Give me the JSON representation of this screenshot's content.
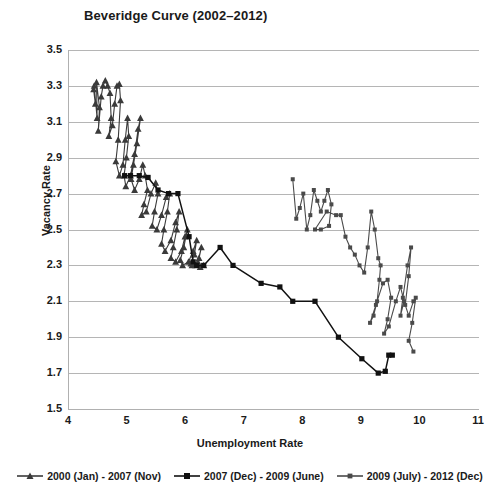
{
  "chart_data": {
    "type": "scatter",
    "title": "Beveridge Curve (2002–2012)",
    "xlabel": "Unemployment Rate",
    "ylabel": "Vacancy Rate",
    "xlim": [
      4,
      11
    ],
    "ylim": [
      1.5,
      3.5
    ],
    "xticks": [
      "4",
      "5",
      "6",
      "7",
      "8",
      "9",
      "10",
      "11"
    ],
    "yticks": [
      "3.5",
      "3.3",
      "3.1",
      "2.9",
      "2.7",
      "2.5",
      "2.3",
      "2.1",
      "1.9",
      "1.7",
      "1.5"
    ],
    "grid": true,
    "legend_position": "bottom",
    "series": [
      {
        "name": "2000 (Jan) - 2007 (Nov)",
        "marker": "triangle",
        "color": "#3a3a3a",
        "points": [
          [
            4.42,
            3.28
          ],
          [
            4.45,
            3.2
          ],
          [
            4.43,
            3.3
          ],
          [
            4.48,
            3.12
          ],
          [
            4.47,
            3.32
          ],
          [
            4.52,
            3.18
          ],
          [
            4.5,
            3.05
          ],
          [
            4.55,
            3.24
          ],
          [
            4.58,
            3.3
          ],
          [
            4.62,
            3.33
          ],
          [
            4.66,
            3.3
          ],
          [
            4.7,
            3.26
          ],
          [
            4.72,
            3.12
          ],
          [
            4.68,
            3.02
          ],
          [
            4.74,
            3.08
          ],
          [
            4.78,
            3.2
          ],
          [
            4.82,
            3.3
          ],
          [
            4.86,
            3.31
          ],
          [
            4.88,
            3.22
          ],
          [
            4.84,
            3.0
          ],
          [
            4.8,
            2.88
          ],
          [
            4.86,
            2.8
          ],
          [
            4.92,
            2.86
          ],
          [
            4.96,
            3.0
          ],
          [
            5.0,
            3.12
          ],
          [
            5.02,
            3.02
          ],
          [
            4.98,
            2.9
          ],
          [
            4.94,
            2.8
          ],
          [
            4.97,
            2.74
          ],
          [
            5.05,
            2.8
          ],
          [
            5.12,
            2.92
          ],
          [
            5.18,
            3.06
          ],
          [
            5.22,
            3.12
          ],
          [
            5.16,
            2.98
          ],
          [
            5.1,
            2.86
          ],
          [
            5.06,
            2.78
          ],
          [
            5.12,
            2.72
          ],
          [
            5.2,
            2.78
          ],
          [
            5.26,
            2.86
          ],
          [
            5.3,
            2.8
          ],
          [
            5.34,
            2.72
          ],
          [
            5.28,
            2.64
          ],
          [
            5.24,
            2.58
          ],
          [
            5.32,
            2.6
          ],
          [
            5.4,
            2.7
          ],
          [
            5.48,
            2.76
          ],
          [
            5.52,
            2.7
          ],
          [
            5.46,
            2.6
          ],
          [
            5.42,
            2.52
          ],
          [
            5.5,
            2.5
          ],
          [
            5.58,
            2.58
          ],
          [
            5.66,
            2.68
          ],
          [
            5.72,
            2.7
          ],
          [
            5.68,
            2.6
          ],
          [
            5.62,
            2.5
          ],
          [
            5.58,
            2.42
          ],
          [
            5.64,
            2.38
          ],
          [
            5.74,
            2.44
          ],
          [
            5.82,
            2.54
          ],
          [
            5.88,
            2.6
          ],
          [
            5.84,
            2.5
          ],
          [
            5.78,
            2.4
          ],
          [
            5.74,
            2.34
          ],
          [
            5.82,
            2.32
          ],
          [
            5.92,
            2.38
          ],
          [
            5.98,
            2.46
          ],
          [
            6.02,
            2.5
          ],
          [
            5.96,
            2.4
          ],
          [
            5.9,
            2.33
          ],
          [
            5.94,
            2.3
          ],
          [
            6.04,
            2.32
          ],
          [
            6.12,
            2.38
          ],
          [
            6.18,
            2.44
          ],
          [
            6.14,
            2.36
          ],
          [
            6.08,
            2.31
          ],
          [
            6.1,
            2.3
          ],
          [
            6.2,
            2.32
          ],
          [
            6.26,
            2.4
          ],
          [
            6.22,
            2.34
          ],
          [
            6.16,
            2.3
          ],
          [
            6.24,
            2.29
          ],
          [
            6.3,
            2.3
          ]
        ]
      },
      {
        "name": "2007 (Dec) - 2009 (June)",
        "marker": "square",
        "color": "#111111",
        "points": [
          [
            4.95,
            2.8
          ],
          [
            5.05,
            2.8
          ],
          [
            5.2,
            2.8
          ],
          [
            5.35,
            2.79
          ],
          [
            5.52,
            2.72
          ],
          [
            5.7,
            2.7
          ],
          [
            5.86,
            2.7
          ],
          [
            6.05,
            2.46
          ],
          [
            6.12,
            2.32
          ],
          [
            6.18,
            2.3
          ],
          [
            6.3,
            2.3
          ],
          [
            6.58,
            2.4
          ],
          [
            6.8,
            2.3
          ],
          [
            7.28,
            2.2
          ],
          [
            7.6,
            2.18
          ],
          [
            7.82,
            2.1
          ],
          [
            8.2,
            2.1
          ],
          [
            8.6,
            1.9
          ],
          [
            9.0,
            1.78
          ],
          [
            9.28,
            1.7
          ],
          [
            9.4,
            1.71
          ],
          [
            9.46,
            1.8
          ],
          [
            9.52,
            1.8
          ]
        ]
      },
      {
        "name": "2009 (July) - 2012 (Dec)",
        "marker": "small-square",
        "color": "#4a4a4a",
        "points": [
          [
            7.82,
            2.78
          ],
          [
            7.88,
            2.56
          ],
          [
            7.94,
            2.62
          ],
          [
            8.0,
            2.7
          ],
          [
            8.06,
            2.5
          ],
          [
            8.12,
            2.58
          ],
          [
            8.18,
            2.72
          ],
          [
            8.24,
            2.66
          ],
          [
            8.3,
            2.6
          ],
          [
            8.36,
            2.66
          ],
          [
            8.42,
            2.72
          ],
          [
            8.48,
            2.64
          ],
          [
            8.44,
            2.52
          ],
          [
            8.3,
            2.5
          ],
          [
            8.2,
            2.5
          ],
          [
            8.4,
            2.6
          ],
          [
            8.56,
            2.58
          ],
          [
            8.64,
            2.58
          ],
          [
            8.72,
            2.46
          ],
          [
            8.8,
            2.4
          ],
          [
            8.88,
            2.36
          ],
          [
            8.96,
            2.3
          ],
          [
            9.04,
            2.26
          ],
          [
            9.1,
            2.4
          ],
          [
            9.16,
            2.6
          ],
          [
            9.22,
            2.5
          ],
          [
            9.28,
            2.34
          ],
          [
            9.32,
            2.3
          ],
          [
            9.3,
            2.22
          ],
          [
            9.26,
            2.1
          ],
          [
            9.2,
            2.02
          ],
          [
            9.14,
            1.98
          ],
          [
            9.24,
            2.08
          ],
          [
            9.36,
            2.2
          ],
          [
            9.44,
            2.22
          ],
          [
            9.5,
            2.12
          ],
          [
            9.44,
            2.0
          ],
          [
            9.38,
            1.92
          ],
          [
            9.46,
            1.96
          ],
          [
            9.58,
            2.1
          ],
          [
            9.66,
            2.18
          ],
          [
            9.72,
            2.1
          ],
          [
            9.66,
            2.02
          ],
          [
            9.7,
            2.12
          ],
          [
            9.78,
            2.3
          ],
          [
            9.84,
            2.4
          ],
          [
            9.8,
            2.24
          ],
          [
            9.74,
            2.08
          ],
          [
            9.8,
            2.02
          ],
          [
            9.88,
            2.1
          ],
          [
            9.92,
            2.12
          ],
          [
            9.86,
            1.98
          ],
          [
            9.8,
            1.88
          ],
          [
            9.88,
            1.82
          ]
        ]
      }
    ]
  }
}
